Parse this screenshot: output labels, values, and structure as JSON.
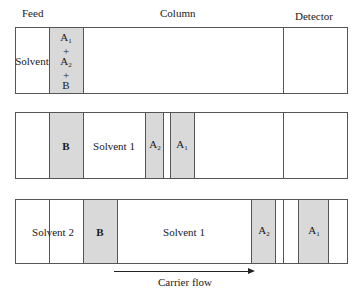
{
  "headers": {
    "feed": "Feed",
    "column": "Column",
    "detector": "Detector"
  },
  "panel1": {
    "solvent_label": "Solvent",
    "feed_band": {
      "a1": "A",
      "a1_sub": "1",
      "plus1": "+",
      "a2": "A",
      "a2_sub": "2",
      "plus2": "+",
      "b": "B"
    }
  },
  "panel2": {
    "b": "B",
    "solvent1": "Solvent 1",
    "a2": "A",
    "a2_sub": "2",
    "a1": "A",
    "a1_sub": "1"
  },
  "panel3": {
    "solvent2": "Solvent 2",
    "b": "B",
    "solvent1": "Solvent 1",
    "a2": "A",
    "a2_sub": "2",
    "a1": "A",
    "a1_sub": "1"
  },
  "flow": {
    "label": "Carrier flow"
  },
  "colors": {
    "band_fill": "#d9d9d9",
    "outline": "#555555"
  }
}
